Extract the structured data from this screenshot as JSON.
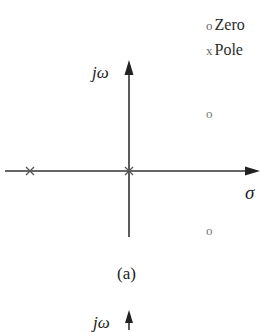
{
  "legend": {
    "zero_marker": "o",
    "zero_label": "Zero",
    "pole_marker": "x",
    "pole_label": "Pole"
  },
  "axes": {
    "imag_label": "jω",
    "real_label": "σ"
  },
  "caption": "(a)",
  "next_figure": {
    "imag_label": "jω"
  },
  "poles": [
    {
      "label": "pole-left",
      "position": "negative real axis"
    },
    {
      "label": "pole-origin",
      "position": "origin"
    }
  ],
  "zeros": [
    {
      "label": "zero-upper",
      "position": "right half plane, upper"
    },
    {
      "label": "zero-lower",
      "position": "right half plane, lower"
    }
  ],
  "colors": {
    "axis": "#333333",
    "marker": "#666666"
  }
}
